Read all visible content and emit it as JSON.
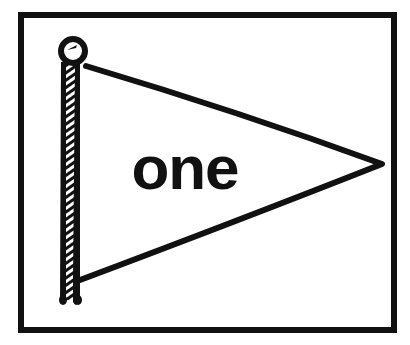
{
  "illustration": {
    "subject": "pennant flag on pole",
    "label": "one",
    "colors": {
      "ink": "#111111",
      "background": "#ffffff"
    }
  }
}
